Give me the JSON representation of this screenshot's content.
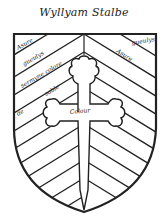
{
  "title": "Wyllyam Stalbe",
  "labels": {
    "l1": "Asure",
    "l2": "gueulys",
    "l3": "sermyne colore",
    "l4": "sable",
    "l5": "de",
    "center": "Colour",
    "r1": "gueulys",
    "r2": "Asure"
  },
  "colors": {
    "ink": "#222222",
    "field": "#ffffff"
  }
}
